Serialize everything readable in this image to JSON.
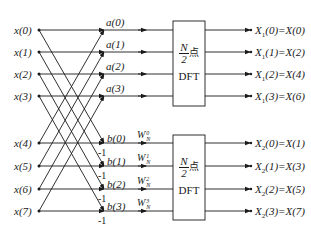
{
  "diagram": {
    "type": "radix-2 DIT FFT butterfly (first stage)",
    "inputs": [
      "x(0)",
      "x(1)",
      "x(2)",
      "x(3)",
      "x(4)",
      "x(5)",
      "x(6)",
      "x(7)"
    ],
    "upper_nodes": [
      "a(0)",
      "a(1)",
      "a(2)",
      "a(3)"
    ],
    "lower_nodes": [
      "b(0)",
      "b(1)",
      "b(2)",
      "b(3)"
    ],
    "negations": [
      "-1",
      "-1",
      "-1",
      "-1"
    ],
    "twiddles": [
      {
        "base": "W",
        "sup": "0",
        "sub": "N"
      },
      {
        "base": "W",
        "sup": "1",
        "sub": "N"
      },
      {
        "base": "W",
        "sup": "2",
        "sub": "N"
      },
      {
        "base": "W",
        "sup": "3",
        "sub": "N"
      }
    ],
    "blocks": [
      {
        "num": "N",
        "den": "2",
        "suffix": "点",
        "label": "DFT"
      },
      {
        "num": "N",
        "den": "2",
        "suffix": "点",
        "label": "DFT"
      }
    ],
    "outputs_top": [
      {
        "name": "X",
        "sub": "1",
        "rest": "(0)=X(0)"
      },
      {
        "name": "X",
        "sub": "1",
        "rest": "(1)=X(2)"
      },
      {
        "name": "X",
        "sub": "1",
        "rest": "(2)=X(4)"
      },
      {
        "name": "X",
        "sub": "1",
        "rest": "(3)=X(6)"
      }
    ],
    "outputs_bottom": [
      {
        "name": "X",
        "sub": "2",
        "rest": "(0)=X(1)"
      },
      {
        "name": "X",
        "sub": "2",
        "rest": "(1)=X(3)"
      },
      {
        "name": "X",
        "sub": "2",
        "rest": "(2)=X(5)"
      },
      {
        "name": "X",
        "sub": "2",
        "rest": "(3)=X(7)"
      }
    ],
    "colors": {
      "line": "#1a1a1a",
      "background": "#ffffff"
    }
  }
}
